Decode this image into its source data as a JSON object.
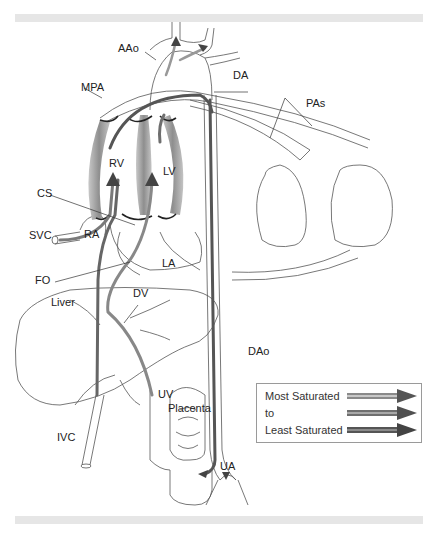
{
  "figure": {
    "labels": {
      "aao": "AAo",
      "da": "DA",
      "mpa": "MPA",
      "pas": "PAs",
      "rv": "RV",
      "lv": "LV",
      "cs": "CS",
      "svc": "SVC",
      "ra": "RA",
      "la": "LA",
      "fo": "FO",
      "dv": "DV",
      "liver": "Liver",
      "dao": "DAo",
      "uv": "UV",
      "placenta": "Placenta",
      "ivc": "IVC",
      "ua": "UA"
    }
  },
  "legend": {
    "items": [
      {
        "label": "Most Saturated",
        "arrow_color": "#8a8a8a"
      },
      {
        "label": "to",
        "arrow_color": "#6e6e6e"
      },
      {
        "label": "Least Saturated",
        "arrow_color": "#555555"
      }
    ]
  },
  "colors": {
    "band": "#e6e6e6",
    "outline": "#555555",
    "heart_muscle": "#9a9a9a",
    "flow_dark": "#4a4a4a",
    "flow_light": "#bdbdbd"
  }
}
